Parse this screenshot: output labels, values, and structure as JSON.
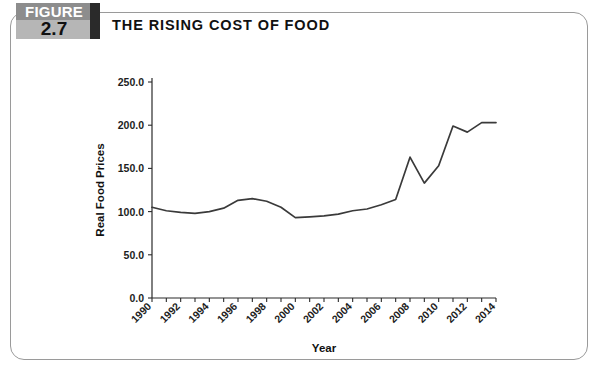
{
  "figure": {
    "label": "FIGURE",
    "number": "2.7"
  },
  "title": "THE RISING COST OF FOOD",
  "caption": "",
  "colors": {
    "band_top": "#8d8d8d",
    "band_bottom": "#b6b6b6",
    "band_tab": "#2a2a2a",
    "frame_border": "#9a9a9a",
    "line": "#3a3a3a",
    "axis": "#2b2b2b",
    "text": "#111111",
    "background": "#ffffff"
  },
  "chart_data": {
    "type": "line",
    "title": "THE RISING COST OF FOOD",
    "xlabel": "Year",
    "ylabel": "Real Food Prices",
    "xlim": [
      1990,
      2014
    ],
    "ylim": [
      0.0,
      250.0
    ],
    "yticks": [
      "0.0",
      "50.0",
      "100.0",
      "150.0",
      "200.0",
      "250.0"
    ],
    "ytick_values": [
      0.0,
      50.0,
      100.0,
      150.0,
      200.0,
      250.0
    ],
    "xticks": [
      "1990",
      "1992",
      "1994",
      "1996",
      "1998",
      "2000",
      "2002",
      "2004",
      "2006",
      "2008",
      "2010",
      "2012",
      "2014"
    ],
    "xtick_values": [
      1990,
      1992,
      1994,
      1996,
      1998,
      2000,
      2002,
      2004,
      2006,
      2008,
      2010,
      2012,
      2014
    ],
    "xtick_rotation": 45,
    "grid": false,
    "legend": false,
    "x": [
      1990,
      1991,
      1992,
      1993,
      1994,
      1995,
      1996,
      1997,
      1998,
      1999,
      2000,
      2001,
      2002,
      2003,
      2004,
      2005,
      2006,
      2007,
      2008,
      2009,
      2010,
      2011,
      2012,
      2013,
      2014
    ],
    "values": [
      105,
      101,
      99,
      98,
      100,
      104,
      113,
      115,
      112,
      105,
      93,
      94,
      95,
      97,
      101,
      103,
      108,
      114,
      163,
      133,
      153,
      199,
      192,
      203,
      203
    ],
    "series": [
      {
        "name": "Real Food Prices",
        "values": [
          105,
          101,
          99,
          98,
          100,
          104,
          113,
          115,
          112,
          105,
          93,
          94,
          95,
          97,
          101,
          103,
          108,
          114,
          163,
          133,
          153,
          199,
          192,
          203,
          203
        ]
      }
    ]
  }
}
